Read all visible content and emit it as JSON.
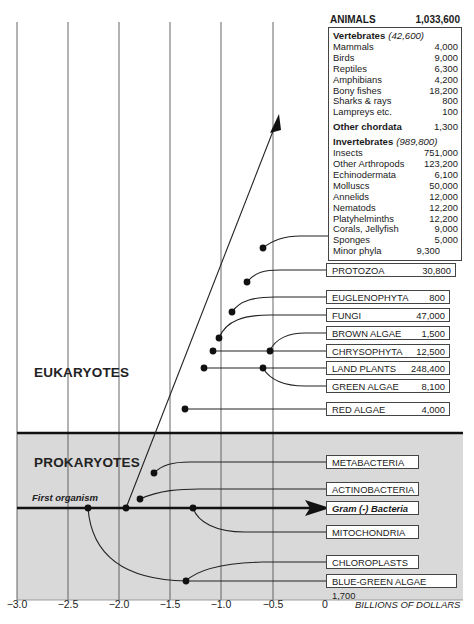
{
  "regions": {
    "eukaryotes": "EUKARYOTES",
    "prokaryotes": "PROKARYOTES",
    "first_organism": "First organism"
  },
  "axis": {
    "ticks": [
      "−3.0",
      "−2.5",
      "−2.0",
      "−1.5",
      "−1.0",
      "−0.5",
      "0"
    ],
    "title": "BILLIONS OF DOLLARS"
  },
  "animals": {
    "title": "ANIMALS",
    "total": "1,033,600",
    "vertebrates": {
      "label": "Vertebrates",
      "total": "(42,600)",
      "items": [
        {
          "name": "Mammals",
          "value": "4,000"
        },
        {
          "name": "Birds",
          "value": "9,000"
        },
        {
          "name": "Reptiles",
          "value": "6,300"
        },
        {
          "name": "Amphibians",
          "value": "4,200"
        },
        {
          "name": "Bony fishes",
          "value": "18,200"
        },
        {
          "name": "Sharks & rays",
          "value": "800"
        },
        {
          "name": "Lampreys etc.",
          "value": "100"
        }
      ]
    },
    "other_chordata": {
      "label": "Other chordata",
      "value": "1,300"
    },
    "invertebrates": {
      "label": "Invertebrates",
      "total": "(989,800)",
      "items": [
        {
          "name": "Insects",
          "value": "751,000"
        },
        {
          "name": "Other Arthropods",
          "value": "123,200"
        },
        {
          "name": "Echinodermata",
          "value": "6,100"
        },
        {
          "name": "Molluscs",
          "value": "50,000"
        },
        {
          "name": "Annelids",
          "value": "12,000"
        },
        {
          "name": "Nematods",
          "value": "12,200"
        },
        {
          "name": "Platyhelminths",
          "value": "12,200"
        },
        {
          "name": "Corals, Jellyfish",
          "value": "9,000"
        },
        {
          "name": "Sponges",
          "value": "5,000"
        },
        {
          "name": "Minor phyla",
          "value": "9,300"
        }
      ]
    }
  },
  "eukaryote_groups": [
    {
      "name": "PROTOZOA",
      "value": "30,800"
    },
    {
      "name": "EUGLENOPHYTA",
      "value": "800"
    },
    {
      "name": "FUNGI",
      "value": "47,000"
    },
    {
      "name": "BROWN ALGAE",
      "value": "1,500"
    },
    {
      "name": "CHRYSOPHYTA",
      "value": "12,500"
    },
    {
      "name": "LAND PLANTS",
      "value": "248,400"
    },
    {
      "name": "GREEN ALGAE",
      "value": "8,100"
    },
    {
      "name": "RED ALGAE",
      "value": "4,000"
    }
  ],
  "prokaryote_groups": [
    {
      "name": "METABACTERIA",
      "value": ""
    },
    {
      "name": "ACTINOBACTERIA",
      "value": ""
    },
    {
      "name": "Gram (-) Bacteria",
      "value": ""
    },
    {
      "name": "MITOCHONDRIA",
      "value": ""
    },
    {
      "name": "CHLOROPLASTS",
      "value": ""
    },
    {
      "name": "BLUE-GREEN ALGAE 1,700",
      "value": ""
    }
  ],
  "colors": {
    "prokaryote_bg": "#d9d9d9",
    "line": "#222222",
    "grid": "#555555"
  }
}
